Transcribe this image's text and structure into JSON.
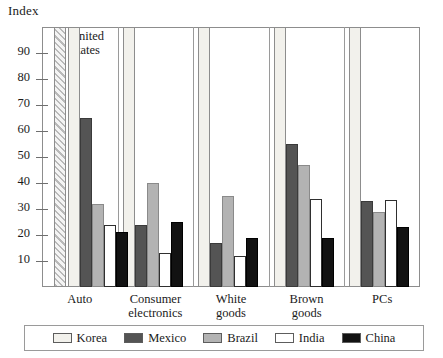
{
  "chart_data": {
    "type": "bar",
    "title": "",
    "ylabel": "Index",
    "xlabel": "",
    "ylim": [
      0,
      100
    ],
    "ytick_labels": [
      "90",
      "80",
      "70",
      "60",
      "50",
      "40",
      "30",
      "20",
      "10"
    ],
    "ytick_values": [
      90,
      80,
      70,
      60,
      50,
      40,
      30,
      20,
      10
    ],
    "grid": false,
    "legend_position": "bottom",
    "categories": [
      "Auto",
      "Consumer electronics",
      "White goods",
      "Brown goods",
      "PCs"
    ],
    "category_lines": [
      [
        "Auto"
      ],
      [
        "Consumer",
        "electronics"
      ],
      [
        "White",
        "goods"
      ],
      [
        "Brown",
        "goods"
      ],
      [
        "PCs"
      ]
    ],
    "series": [
      {
        "name": "Korea",
        "color": "#f2f1ec",
        "values": [
          100,
          100,
          100,
          100,
          100
        ]
      },
      {
        "name": "Mexico",
        "color": "#545454",
        "values": [
          65,
          24,
          17,
          55,
          33
        ]
      },
      {
        "name": "Brazil",
        "color": "#b3b3b3",
        "values": [
          32,
          40,
          35,
          47,
          29
        ]
      },
      {
        "name": "India",
        "color": "#ffffff",
        "values": [
          24,
          13,
          12,
          34,
          33.5
        ]
      },
      {
        "name": "China",
        "color": "#121212",
        "values": [
          21,
          25,
          19,
          19,
          23
        ]
      }
    ],
    "reference_bar": {
      "label_line1": "United",
      "label_line2": "States",
      "value": 100,
      "pattern": "diagonal-hatch"
    },
    "annotations": []
  }
}
